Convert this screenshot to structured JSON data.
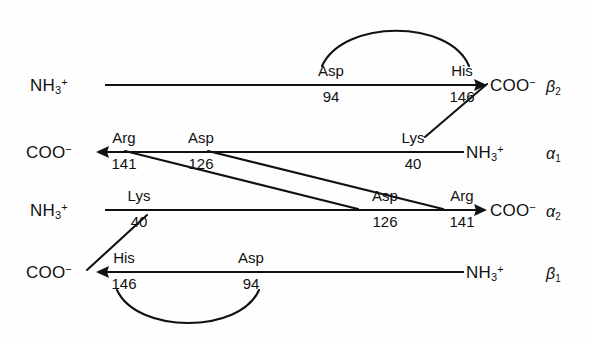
{
  "figure": {
    "type": "diagram",
    "background_color": "#fefefe",
    "line_color": "#111111"
  },
  "chains": [
    {
      "id": "beta2",
      "label": "β",
      "label_sub": "2",
      "n_terminus": "NH",
      "n_sub": "3",
      "n_sup": "+",
      "c_terminus": "COO",
      "c_sup": "−",
      "direction": "right",
      "left_text_x": 30,
      "left_text_y": 76,
      "line_y": 85,
      "line_x1": 105,
      "line_x2": 487,
      "right_text_x": 490,
      "right_text_y": 76,
      "subunit_x": 546,
      "subunit_y": 78,
      "residues": [
        {
          "name": "Asp",
          "number": "94",
          "x": 331,
          "name_y": 62,
          "num_y": 88
        },
        {
          "name": "His",
          "number": "146",
          "x": 462,
          "name_y": 62,
          "num_y": 88
        }
      ]
    },
    {
      "id": "alpha1",
      "label": "α",
      "label_sub": "1",
      "n_terminus": "NH",
      "n_sub": "3",
      "n_sup": "+",
      "c_terminus": "COO",
      "c_sup": "−",
      "direction": "left",
      "left_text_x": 26,
      "left_text_y": 143,
      "line_y": 152,
      "line_x1": 96,
      "line_x2": 464,
      "right_text_x": 466,
      "right_text_y": 143,
      "subunit_x": 546,
      "subunit_y": 145,
      "residues": [
        {
          "name": "Arg",
          "number": "141",
          "x": 124,
          "name_y": 129,
          "num_y": 155
        },
        {
          "name": "Asp",
          "number": "126",
          "x": 201,
          "name_y": 129,
          "num_y": 155
        },
        {
          "name": "Lys",
          "number": "40",
          "x": 413,
          "name_y": 129,
          "num_y": 155
        }
      ]
    },
    {
      "id": "alpha2",
      "label": "α",
      "label_sub": "2",
      "n_terminus": "NH",
      "n_sub": "3",
      "n_sup": "+",
      "c_terminus": "COO",
      "c_sup": "−",
      "direction": "right",
      "left_text_x": 30,
      "left_text_y": 201,
      "line_y": 210,
      "line_x1": 105,
      "line_x2": 487,
      "right_text_x": 490,
      "right_text_y": 201,
      "subunit_x": 546,
      "subunit_y": 203,
      "residues": [
        {
          "name": "Lys",
          "number": "40",
          "x": 139,
          "name_y": 187,
          "num_y": 213
        },
        {
          "name": "Asp",
          "number": "126",
          "x": 385,
          "name_y": 187,
          "num_y": 213
        },
        {
          "name": "Arg",
          "number": "141",
          "x": 462,
          "name_y": 187,
          "num_y": 213
        }
      ]
    },
    {
      "id": "beta1",
      "label": "β",
      "label_sub": "1",
      "n_terminus": "NH",
      "n_sub": "3",
      "n_sup": "+",
      "c_terminus": "COO",
      "c_sup": "−",
      "direction": "left",
      "left_text_x": 26,
      "left_text_y": 263,
      "line_y": 272,
      "line_x1": 96,
      "line_x2": 464,
      "right_text_x": 466,
      "right_text_y": 263,
      "subunit_x": 546,
      "subunit_y": 265,
      "residues": [
        {
          "name": "His",
          "number": "146",
          "x": 124,
          "name_y": 249,
          "num_y": 275
        },
        {
          "name": "Asp",
          "number": "94",
          "x": 251,
          "name_y": 249,
          "num_y": 275
        }
      ]
    }
  ],
  "bridges": [
    {
      "id": "beta2-intrachain-arc",
      "from": "Asp 94 (β2)",
      "to": "His 146 (β2)",
      "shape": "arc-above",
      "path": "M 322,66 C 344,19 449,19 469,66"
    },
    {
      "id": "beta1-intrachain-arc",
      "from": "His 146 (β1)",
      "to": "Asp 94 (β1)",
      "shape": "arc-below",
      "path": "M 117,290 C 137,334 240,334 259,290"
    },
    {
      "id": "beta2-his146-to-alpha1-lys40",
      "from": "His 146 / COO− (β2)",
      "to": "Lys 40 (α1)",
      "shape": "diagonal",
      "x1": 487,
      "y1": 84,
      "x2": 425,
      "y2": 137
    },
    {
      "id": "alpha2-lys40-to-beta1-his146",
      "from": "Lys 40 (α2)",
      "to": "His 146 / COO− (β1)",
      "shape": "diagonal",
      "x1": 147,
      "y1": 215,
      "x2": 87,
      "y2": 270
    },
    {
      "id": "alpha1-arg141-to-alpha2-asp126",
      "from": "Arg 141 (α1)",
      "to": "Asp 126 (α2)",
      "shape": "diagonal-long",
      "x1": 125,
      "y1": 151,
      "x2": 358,
      "y2": 209
    },
    {
      "id": "alpha1-asp126-to-alpha2-arg141",
      "from": "Asp 126 (α1)",
      "to": "Arg 141 (α2)",
      "shape": "diagonal-long",
      "x1": 208,
      "y1": 151,
      "x2": 443,
      "y2": 209
    }
  ]
}
